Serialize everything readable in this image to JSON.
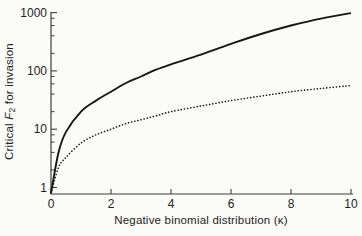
{
  "figure": {
    "background": "#fbfbf8",
    "axis_color": "#3f3f3f",
    "text_color": "#242424"
  },
  "chart_data": {
    "type": "line",
    "title": "",
    "xlabel": "Negative binomial distribution (κ)",
    "ylabel_text": "Critical F2 for invasion",
    "ylabel_parts": {
      "prefix": "Critical ",
      "var": "F",
      "sub": "2",
      "suffix": " for invasion"
    },
    "grid": false,
    "legend": false,
    "x_axis": {
      "scale": "linear",
      "min": 0,
      "max": 10,
      "ticks": [
        0,
        2,
        4,
        6,
        8,
        10
      ]
    },
    "y_axis": {
      "scale": "log",
      "min": 0.8,
      "max": 1100,
      "major_ticks": [
        1,
        10,
        100,
        1000
      ],
      "minor_tick_multipliers": [
        2,
        4,
        6,
        8
      ]
    },
    "series": [
      {
        "name": "upper-solid-curve",
        "style": "solid",
        "color": "#161616",
        "x": [
          0,
          0.25,
          0.5,
          1,
          1.5,
          2,
          2.5,
          3,
          3.5,
          4,
          5,
          6,
          7,
          8,
          9,
          10
        ],
        "y": [
          0.8,
          4,
          9,
          20,
          31,
          44,
          62,
          80,
          105,
          130,
          190,
          290,
          430,
          600,
          790,
          980
        ]
      },
      {
        "name": "lower-dotted-curve",
        "style": "dotted",
        "color": "#161616",
        "x": [
          0,
          0.25,
          0.5,
          1,
          1.5,
          2,
          2.5,
          3,
          3.5,
          4,
          5,
          6,
          7,
          8,
          9,
          10
        ],
        "y": [
          0.8,
          2.2,
          3.3,
          5.8,
          8,
          10,
          12.5,
          14.5,
          17,
          20,
          25,
          31,
          37,
          44,
          50,
          56
        ]
      }
    ]
  }
}
